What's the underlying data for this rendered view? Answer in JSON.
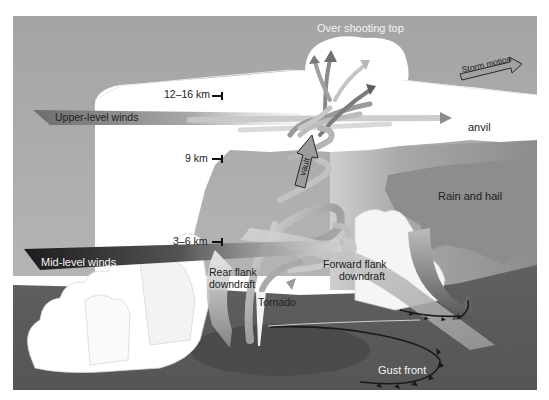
{
  "diagram": {
    "labels": {
      "overshooting_top": "Over shooting top",
      "storm_motion": "Storm motion",
      "upper_level_winds": "Upper-level winds",
      "anvil": "anvil",
      "vault": "vault",
      "rain_and_hail": "Rain and hail",
      "mid_level_winds": "Mid-level winds",
      "rear_flank_downdraft_1": "Rear flank",
      "rear_flank_downdraft_2": "downdraft",
      "forward_flank_downdraft_1": "Forward flank",
      "forward_flank_downdraft_2": "downdraft",
      "tornado": "Tornado",
      "gust_front": "Gust front"
    },
    "altitudes": [
      {
        "label": "12–16 km"
      },
      {
        "label": "9 km"
      },
      {
        "label": "3–6 km"
      }
    ],
    "colors": {
      "sky": "#a9a9a9",
      "sky_dark": "#9a9a9a",
      "cloud": "#ffffff",
      "rain_area": "#8a8a8a",
      "ground": "#5e5e5e",
      "ground_dark": "#4c4c4c",
      "updraft_ribbon": "#b8b8b8",
      "mid_level_arrow": "#333333",
      "upper_level_arrow": "#7a7a7a"
    }
  }
}
